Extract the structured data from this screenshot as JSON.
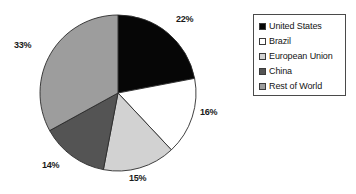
{
  "chart_data": {
    "type": "pie",
    "title": "",
    "categories": [
      "United States",
      "Brazil",
      "European Union",
      "China",
      "Rest of World"
    ],
    "values": [
      22,
      16,
      15,
      14,
      33
    ],
    "value_labels": [
      "22%",
      "16%",
      "15%",
      "14%",
      "33%"
    ],
    "slice_colors": [
      "#060606",
      "#ffffff",
      "#d2d2d2",
      "#545454",
      "#9d9d9d"
    ],
    "slice_start_angle_deg": 0,
    "direction": "clockwise",
    "units": "percent",
    "legend_position": "right",
    "grid": false
  },
  "legend": {
    "items": [
      {
        "label": "United States",
        "swatch": "#060606",
        "value_label": "22%"
      },
      {
        "label": "Brazil",
        "swatch": "#ffffff",
        "value_label": "16%"
      },
      {
        "label": "European Union",
        "swatch": "#d2d2d2",
        "value_label": "15%"
      },
      {
        "label": "China",
        "swatch": "#545454",
        "value_label": "14%"
      },
      {
        "label": "Rest of World",
        "swatch": "#9d9d9d",
        "value_label": "33%"
      }
    ]
  },
  "labels": {
    "us": "22%",
    "brazil": "16%",
    "eu": "15%",
    "china": "14%",
    "rest": "33%"
  }
}
